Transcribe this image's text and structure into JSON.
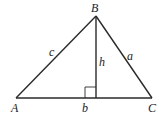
{
  "diagram": {
    "type": "triangle-with-altitude",
    "vertices": {
      "A": {
        "label": "A",
        "x": 16,
        "y": 98
      },
      "B": {
        "label": "B",
        "x": 96,
        "y": 16
      },
      "C": {
        "label": "C",
        "x": 152,
        "y": 98
      }
    },
    "foot": {
      "x": 96,
      "y": 98
    },
    "sides": {
      "c": {
        "label": "c"
      },
      "a": {
        "label": "a"
      },
      "b": {
        "label": "b"
      }
    },
    "altitude": {
      "label": "h"
    },
    "right_angle_marker": true,
    "colors": {
      "stroke": "#2a2a2a",
      "text": "#222222",
      "background": "#ffffff"
    }
  }
}
